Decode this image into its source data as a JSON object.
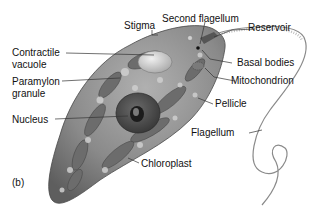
{
  "diagram": {
    "panel_label": "(b)",
    "labels": {
      "stigma": "Stigma",
      "second_flagellum": "Second flagellum",
      "reservoir": "Reservoir",
      "contractile_vacuole_1": "Contractile",
      "contractile_vacuole_2": "vacuole",
      "paramylon_granule_1": "Paramylon",
      "paramylon_granule_2": "granule",
      "basal_bodies": "Basal bodies",
      "mitochondrion": "Mitochondrion",
      "pellicle": "Pellicle",
      "nucleus": "Nucleus",
      "flagellum": "Flagellum",
      "chloroplast": "Chloroplast"
    },
    "colors": {
      "cell_body": "#8c8c8c",
      "cell_shadow": "#5a5a5a",
      "highlight": "#d8d8d8",
      "leader_line": "#333333",
      "text": "#111111"
    }
  }
}
